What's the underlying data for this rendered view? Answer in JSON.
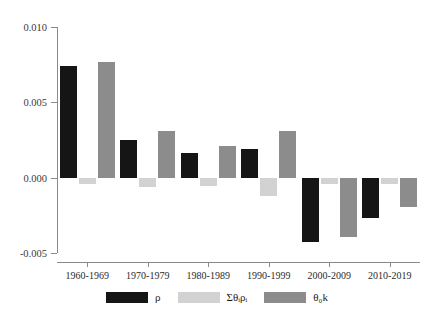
{
  "chart_data": {
    "type": "bar",
    "title": "",
    "subtitle": "",
    "xlabel": "",
    "ylabel": "",
    "categories": [
      "1960-1969",
      "1970-1979",
      "1980-1989",
      "1990-1999",
      "2000-2009",
      "2010-2019"
    ],
    "series": [
      {
        "name": "rho",
        "label": "ρ",
        "color": "#151515",
        "values": [
          0.00742,
          0.0025,
          0.00167,
          0.00193,
          -0.00428,
          -0.00271
        ]
      },
      {
        "name": "sum-theta-i-rho-i",
        "label": "Σθᵢρᵢ",
        "color": "#d2d2d2",
        "values": [
          -0.0004,
          -0.00063,
          -0.00053,
          -0.00119,
          -0.00044,
          -0.00044
        ]
      },
      {
        "name": "theta-0-k",
        "label": "θ₀k",
        "color": "#8c8c8c",
        "values": [
          0.00769,
          0.00313,
          0.00207,
          0.00313,
          -0.00397,
          -0.00198
        ]
      }
    ],
    "yticks": [
      0.01,
      0.005,
      0.0,
      -0.005
    ],
    "ytick_labels": [
      "0.010",
      "0.005",
      "0.000",
      "-0.005"
    ],
    "ylim": [
      -0.005,
      0.01
    ],
    "grid": false,
    "legend_position": "bottom",
    "axis_color": "#8a8a8a"
  },
  "legend": {
    "items": [
      {
        "label": "ρ",
        "color": "#151515"
      },
      {
        "label": "Σθᵢρᵢ",
        "color": "#d2d2d2"
      },
      {
        "label": "θ₀k",
        "color": "#8c8c8c"
      }
    ]
  }
}
